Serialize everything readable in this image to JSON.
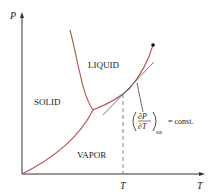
{
  "diagram": {
    "type": "phase-diagram",
    "axes": {
      "y_label": "P",
      "x_label": "T",
      "x_tick_label": "T"
    },
    "regions": {
      "liquid": "LIQUID",
      "solid": "SOLID",
      "vapor": "VAPOR"
    },
    "annotation": {
      "partial_num": "∂P",
      "partial_den": "∂T",
      "subscript": "sat",
      "equals": "= const."
    },
    "colors": {
      "curve": "#b5524a",
      "axis": "#333333",
      "tangent": "#555555",
      "dashed": "#666666"
    }
  }
}
